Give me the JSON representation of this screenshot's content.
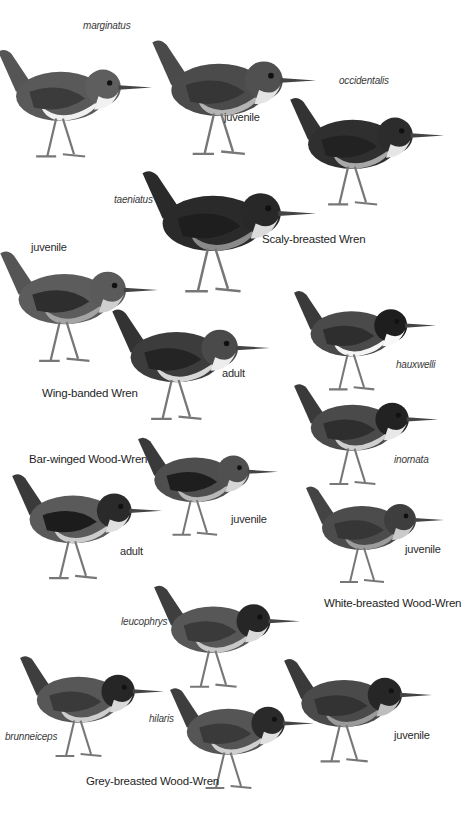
{
  "plate": {
    "species": [
      {
        "name": "Scaly-breasted Wren",
        "labels": [
          {
            "text": "marginatus",
            "style": "italic"
          },
          {
            "text": "juvenile",
            "style": "plain"
          },
          {
            "text": "occidentalis",
            "style": "italic"
          },
          {
            "text": "taeniatus",
            "style": "italic"
          }
        ]
      },
      {
        "name": "Wing-banded Wren",
        "labels": [
          {
            "text": "juvenile",
            "style": "plain"
          },
          {
            "text": "adult",
            "style": "plain"
          }
        ]
      },
      {
        "name": "Bar-winged Wood-Wren",
        "labels": [
          {
            "text": "adult",
            "style": "plain"
          },
          {
            "text": "juvenile",
            "style": "plain"
          }
        ]
      },
      {
        "name": "White-breasted Wood-Wren",
        "labels": [
          {
            "text": "hauxwelli",
            "style": "italic"
          },
          {
            "text": "inornata",
            "style": "italic"
          },
          {
            "text": "juvenile",
            "style": "plain"
          }
        ]
      },
      {
        "name": "Grey-breasted Wood-Wren",
        "labels": [
          {
            "text": "leucophrys",
            "style": "italic"
          },
          {
            "text": "brunneiceps",
            "style": "italic"
          },
          {
            "text": "hilaris",
            "style": "italic"
          },
          {
            "text": "juvenile",
            "style": "plain"
          }
        ]
      }
    ]
  }
}
